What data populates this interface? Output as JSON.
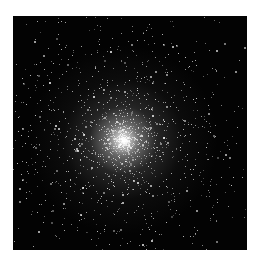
{
  "image": {
    "subject": "globular star cluster",
    "background_color": "#030303",
    "star_color": "#ffffff",
    "frame": {
      "left": 13,
      "top": 16,
      "width": 234,
      "height": 234
    },
    "core_center": {
      "x_pct": 47,
      "y_pct": 53
    }
  }
}
